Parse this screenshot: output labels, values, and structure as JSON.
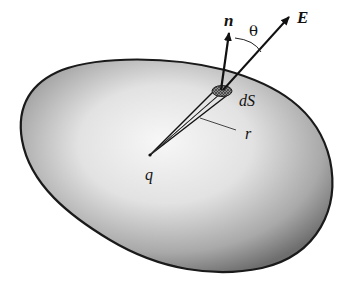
{
  "figure": {
    "labels": {
      "normal": "n",
      "field": "E",
      "angle": "θ",
      "surface_element": "dS",
      "radius": "r",
      "charge": "q"
    },
    "colors": {
      "outline": "#1a1a1a",
      "fill_light": "#f4f4f4",
      "fill_dark": "#7a7a7a",
      "patch": "#555555"
    }
  }
}
